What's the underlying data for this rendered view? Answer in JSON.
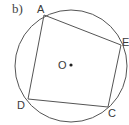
{
  "figure": {
    "part_label": "b)",
    "center_label": "O",
    "vertex_labels": {
      "A": "A",
      "E": "E",
      "C": "C",
      "D": "D"
    },
    "quadrilateral_order": [
      "A",
      "E",
      "C",
      "D"
    ],
    "colors": {
      "line": "#555555",
      "text": "#3a3a3a",
      "background": "#ffffff"
    }
  }
}
